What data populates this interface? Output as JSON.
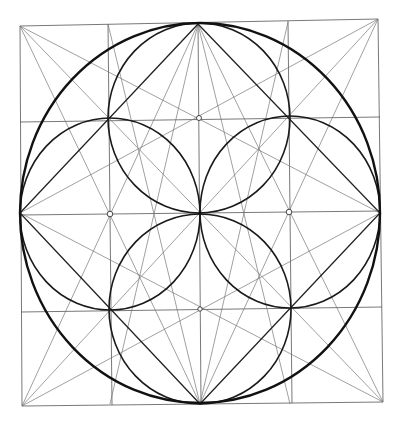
{
  "diagram": {
    "title": "Geometric construction: circle in square with four petal circles",
    "square": {
      "x1": 20,
      "y1": 24,
      "x2": 380,
      "y2": 404
    },
    "grid": {
      "xs": [
        20,
        110,
        200,
        290,
        380
      ],
      "ys": [
        24,
        120,
        213,
        309,
        404
      ]
    },
    "center": {
      "x": 200,
      "y": 213
    },
    "outer_circle": {
      "cx": 200,
      "cy": 213,
      "rx": 180,
      "ry": 190
    },
    "petal_circles": [
      {
        "cx": 200,
        "cy": 118,
        "rx": 92,
        "ry": 95
      },
      {
        "cx": 110,
        "cy": 213,
        "rx": 92,
        "ry": 95
      },
      {
        "cx": 290,
        "cy": 213,
        "rx": 92,
        "ry": 95
      },
      {
        "cx": 200,
        "cy": 309,
        "rx": 92,
        "ry": 95
      }
    ],
    "marked_points": [
      {
        "x": 200,
        "y": 118
      },
      {
        "x": 110,
        "y": 213
      },
      {
        "x": 290,
        "y": 213
      },
      {
        "x": 200,
        "y": 309
      }
    ],
    "colors": {
      "stroke": "#111111",
      "background": "#ffffff"
    }
  }
}
